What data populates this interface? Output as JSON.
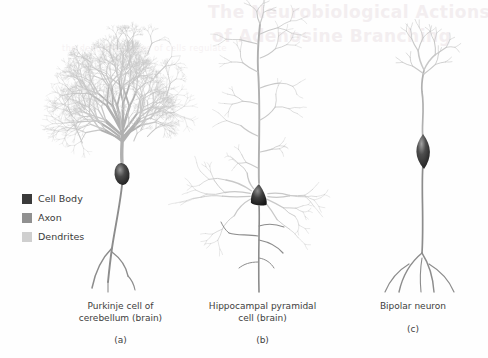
{
  "figure": {
    "background_color": "#fefefe",
    "width": 488,
    "height": 358
  },
  "bleed_through_text": {
    "line1": "The Neurobiological Actions",
    "line2": "of Adenosine Branching",
    "line3": "the dendritic spines of cells regulate"
  },
  "legend": {
    "items": [
      {
        "label": "Cell Body",
        "color": "#3a3a3a",
        "name": "cell-body"
      },
      {
        "label": "Axon",
        "color": "#909090",
        "name": "axon"
      },
      {
        "label": "Dendrites",
        "color": "#cfcfcf",
        "name": "dendrites"
      }
    ]
  },
  "panels": [
    {
      "letter": "(a)",
      "title_line1": "Purkinje cell of",
      "title_line2": "cerebellum (brain)",
      "type": "purkinje"
    },
    {
      "letter": "(b)",
      "title_line1": "Hippocampal pyramidal",
      "title_line2": "cell (brain)",
      "type": "pyramidal"
    },
    {
      "letter": "(c)",
      "title_line1": "Bipolar neuron",
      "title_line2": "",
      "type": "bipolar"
    }
  ],
  "colors": {
    "dendrite_light": "#c8c8c8",
    "dendrite_mid": "#b0b0b0",
    "axon_gray": "#8c8c8c",
    "soma_dark": "#2b2b2b",
    "soma_highlight": "#6e6e6e",
    "caption_text": "#3d3d3d"
  },
  "drawing_params": {
    "purkinje": {
      "soma_cx": 122,
      "soma_cy": 174,
      "soma_rx": 7.5,
      "soma_ry": 11,
      "trunk_x": 122,
      "trunk_top_y": 162,
      "arbor_base_y": 160,
      "arbor_top_y": 26,
      "arbor_half_width": 78,
      "branch_depth": 8,
      "axon_end_y": 292
    },
    "pyramidal": {
      "soma_cx": 259,
      "soma_cy": 195,
      "soma_w": 18,
      "soma_h": 20,
      "apical_top_y": 24,
      "basal_count": 9,
      "axon_end_y": 292
    },
    "bipolar": {
      "soma_cx": 423,
      "soma_cy": 151,
      "soma_rx": 9,
      "soma_ry": 14,
      "dendrite_top_y": 30,
      "axon_end_y": 292
    }
  }
}
